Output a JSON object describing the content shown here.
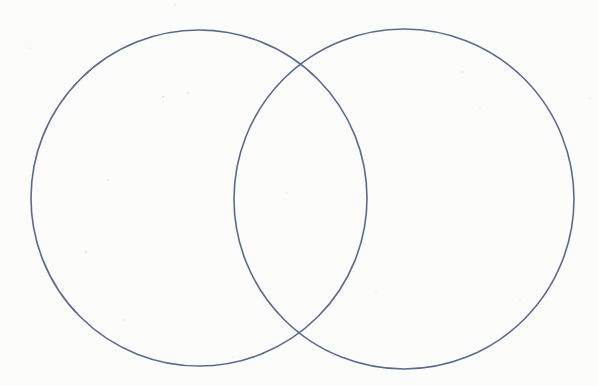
{
  "diagram": {
    "type": "venn",
    "set_count": 2,
    "stroke_color": "#5a6a8f",
    "stroke_width": 1.6,
    "background_color": "#fcfcfb",
    "sets": [
      {
        "id": "left",
        "label": "",
        "cx": 199,
        "cy": 198,
        "r": 168
      },
      {
        "id": "right",
        "label": "",
        "cx": 404,
        "cy": 199,
        "r": 170
      }
    ],
    "intersection_points": [
      {
        "x": 300,
        "y": 60
      },
      {
        "x": 300,
        "y": 338
      }
    ]
  }
}
